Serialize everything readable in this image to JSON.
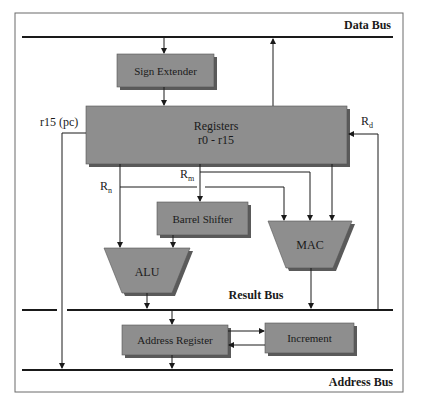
{
  "diagram": {
    "title": "",
    "colors": {
      "block_fill": "#8e8e8e",
      "block_shadow": "#5a5a5a",
      "line": "#1a1a1a",
      "frame": "#6a6a6a",
      "background": "#ffffff"
    },
    "buses": {
      "data_bus": "Data Bus",
      "result_bus": "Result Bus",
      "address_bus": "Address Bus"
    },
    "blocks": {
      "sign_extender": "Sign Extender",
      "registers_line1": "Registers",
      "registers_line2": "r0 - r15",
      "barrel_shifter": "Barrel Shifter",
      "alu": "ALU",
      "mac": "MAC",
      "address_register": "Address Register",
      "increment": "Increment"
    },
    "signals": {
      "pc": "r15 (pc)",
      "rd_main": "R",
      "rd_sub": "d",
      "rn_main": "R",
      "rn_sub": "n",
      "rm_main": "R",
      "rm_sub": "m"
    }
  }
}
